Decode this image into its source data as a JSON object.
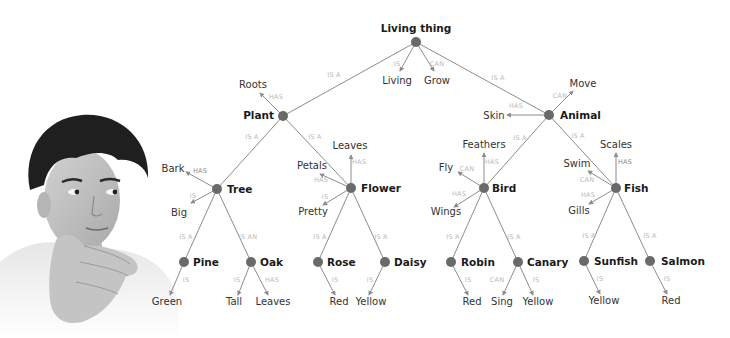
{
  "diagram": {
    "colors": {
      "node": "#6a6a6a",
      "edge": "#8c8c8c",
      "node_text": "#1a1a1a",
      "leaf_text": "#333333",
      "relation_text": "#b9b9b9"
    },
    "nodes": [
      {
        "id": "living_thing",
        "label": "Living thing",
        "x": 416,
        "y": 42,
        "lx": 416,
        "ly": 32,
        "anchor": "middle"
      },
      {
        "id": "plant",
        "label": "Plant",
        "x": 283,
        "y": 116,
        "lx": 274,
        "ly": 119,
        "anchor": "end"
      },
      {
        "id": "animal",
        "label": "Animal",
        "x": 549,
        "y": 115,
        "lx": 560,
        "ly": 119,
        "anchor": "start"
      },
      {
        "id": "tree",
        "label": "Tree",
        "x": 217,
        "y": 189,
        "lx": 227,
        "ly": 193,
        "anchor": "start"
      },
      {
        "id": "flower",
        "label": "Flower",
        "x": 351,
        "y": 188,
        "lx": 361,
        "ly": 192,
        "anchor": "start"
      },
      {
        "id": "bird",
        "label": "Bird",
        "x": 484,
        "y": 188,
        "lx": 492,
        "ly": 192,
        "anchor": "start"
      },
      {
        "id": "fish",
        "label": "Fish",
        "x": 616,
        "y": 188,
        "lx": 624,
        "ly": 192,
        "anchor": "start"
      },
      {
        "id": "pine",
        "label": "Pine",
        "x": 184,
        "y": 262,
        "lx": 193,
        "ly": 266,
        "anchor": "start"
      },
      {
        "id": "oak",
        "label": "Oak",
        "x": 251,
        "y": 262,
        "lx": 260,
        "ly": 266,
        "anchor": "start"
      },
      {
        "id": "rose",
        "label": "Rose",
        "x": 318,
        "y": 262,
        "lx": 327,
        "ly": 266,
        "anchor": "start"
      },
      {
        "id": "daisy",
        "label": "Daisy",
        "x": 385,
        "y": 262,
        "lx": 394,
        "ly": 266,
        "anchor": "start"
      },
      {
        "id": "robin",
        "label": "Robin",
        "x": 451,
        "y": 262,
        "lx": 461,
        "ly": 266,
        "anchor": "start"
      },
      {
        "id": "canary",
        "label": "Canary",
        "x": 518,
        "y": 262,
        "lx": 527,
        "ly": 266,
        "anchor": "start"
      },
      {
        "id": "sunfish",
        "label": "Sunfish",
        "x": 584,
        "y": 261,
        "lx": 594,
        "ly": 265,
        "anchor": "start"
      },
      {
        "id": "salmon",
        "label": "Salmon",
        "x": 650,
        "y": 261,
        "lx": 661,
        "ly": 265,
        "anchor": "start"
      }
    ],
    "hierarchy_edges": [
      {
        "from": "living_thing",
        "to": "plant",
        "relation": "IS A",
        "rx": 334,
        "ry": 77
      },
      {
        "from": "living_thing",
        "to": "animal",
        "relation": "IS A",
        "rx": 498,
        "ry": 80
      },
      {
        "from": "plant",
        "to": "tree",
        "relation": "IS A",
        "rx": 252,
        "ry": 139
      },
      {
        "from": "plant",
        "to": "flower",
        "relation": "IS A",
        "rx": 315,
        "ry": 139
      },
      {
        "from": "animal",
        "to": "bird",
        "relation": "IS A",
        "rx": 520,
        "ry": 140
      },
      {
        "from": "animal",
        "to": "fish",
        "relation": "IS A",
        "rx": 578,
        "ry": 138
      },
      {
        "from": "tree",
        "to": "pine",
        "relation": "IS A",
        "rx": 186,
        "ry": 239
      },
      {
        "from": "tree",
        "to": "oak",
        "relation": "IS AN",
        "rx": 248,
        "ry": 239
      },
      {
        "from": "flower",
        "to": "rose",
        "relation": "IS A",
        "rx": 320,
        "ry": 239
      },
      {
        "from": "flower",
        "to": "daisy",
        "relation": "IS A",
        "rx": 381,
        "ry": 239
      },
      {
        "from": "bird",
        "to": "robin",
        "relation": "IS A",
        "rx": 453,
        "ry": 239
      },
      {
        "from": "bird",
        "to": "canary",
        "relation": "IS A",
        "rx": 514,
        "ry": 239
      },
      {
        "from": "fish",
        "to": "sunfish",
        "relation": "IS A",
        "rx": 589,
        "ry": 238
      },
      {
        "from": "fish",
        "to": "salmon",
        "relation": "IS A",
        "rx": 650,
        "ry": 238
      }
    ],
    "attributes": [
      {
        "node": "living_thing",
        "relation": "IS",
        "label": "Living",
        "ax": 400,
        "ay": 71,
        "lx": 397,
        "ly": 84,
        "anchor": "middle",
        "rx": 397,
        "ry": 66
      },
      {
        "node": "living_thing",
        "relation": "CAN",
        "label": "Grow",
        "ax": 434,
        "ay": 71,
        "lx": 437,
        "ly": 84,
        "anchor": "middle",
        "rx": 437,
        "ry": 66
      },
      {
        "node": "plant",
        "relation": "HAS",
        "label": "Roots",
        "ax": 260,
        "ay": 93,
        "lx": 253,
        "ly": 88,
        "anchor": "middle",
        "rx": 276,
        "ry": 99
      },
      {
        "node": "animal",
        "relation": "CAN",
        "label": "Move",
        "ax": 573,
        "ay": 91,
        "lx": 583,
        "ly": 87,
        "anchor": "middle",
        "rx": 560,
        "ry": 98
      },
      {
        "node": "animal",
        "relation": "HAS",
        "label": "Skin",
        "ax": 507,
        "ay": 115,
        "lx": 494,
        "ly": 119,
        "anchor": "middle",
        "rx": 516,
        "ry": 108
      },
      {
        "node": "tree",
        "relation": "HAS",
        "label": "Bark",
        "ax": 186,
        "ay": 172,
        "lx": 173,
        "ly": 172,
        "anchor": "middle",
        "rx": 200,
        "ry": 173,
        "dark": true
      },
      {
        "node": "tree",
        "relation": "IS",
        "label": "Big",
        "ax": 191,
        "ay": 203,
        "lx": 179,
        "ly": 216,
        "anchor": "middle",
        "rx": 193,
        "ry": 198
      },
      {
        "node": "flower",
        "relation": "HAS",
        "label": "Leaves",
        "ax": 351,
        "ay": 155,
        "lx": 350,
        "ly": 149,
        "anchor": "middle",
        "rx": 359,
        "ry": 164
      },
      {
        "node": "flower",
        "relation": "HAS",
        "label": "Petals",
        "ax": 320,
        "ay": 174,
        "lx": 312,
        "ly": 169,
        "anchor": "middle",
        "rx": 321,
        "ry": 182
      },
      {
        "node": "flower",
        "relation": "IS",
        "label": "Pretty",
        "ax": 323,
        "ay": 205,
        "lx": 313,
        "ly": 215,
        "anchor": "middle",
        "rx": 325,
        "ry": 199
      },
      {
        "node": "bird",
        "relation": "HAS",
        "label": "Feathers",
        "ax": 484,
        "ay": 153,
        "lx": 484,
        "ly": 148,
        "anchor": "middle",
        "rx": 492,
        "ry": 164
      },
      {
        "node": "bird",
        "relation": "CAN",
        "label": "Fly",
        "ax": 458,
        "ay": 172,
        "lx": 446,
        "ly": 171,
        "anchor": "middle",
        "rx": 467,
        "ry": 171
      },
      {
        "node": "bird",
        "relation": "HAS",
        "label": "Wings",
        "ax": 454,
        "ay": 207,
        "lx": 446,
        "ly": 215,
        "anchor": "middle",
        "rx": 459,
        "ry": 196
      },
      {
        "node": "fish",
        "relation": "HAS",
        "label": "Scales",
        "ax": 616,
        "ay": 153,
        "lx": 616,
        "ly": 148,
        "anchor": "middle",
        "rx": 625,
        "ry": 164,
        "dark": true
      },
      {
        "node": "fish",
        "relation": "CAN",
        "label": "Swim",
        "ax": 588,
        "ay": 171,
        "lx": 577,
        "ly": 167,
        "anchor": "middle",
        "rx": 587,
        "ry": 182
      },
      {
        "node": "fish",
        "relation": "HAS",
        "label": "Gills",
        "ax": 589,
        "ay": 204,
        "lx": 579,
        "ly": 214,
        "anchor": "middle",
        "rx": 588,
        "ry": 197
      },
      {
        "node": "pine",
        "relation": "IS",
        "label": "Green",
        "ax": 170,
        "ay": 295,
        "lx": 167,
        "ly": 305,
        "anchor": "middle",
        "rx": 186,
        "ry": 282
      },
      {
        "node": "oak",
        "relation": "IS",
        "label": "Tall",
        "ax": 238,
        "ay": 295,
        "lx": 234,
        "ly": 305,
        "anchor": "middle",
        "rx": 237,
        "ry": 282
      },
      {
        "node": "oak",
        "relation": "HAS",
        "label": "Leaves",
        "ax": 268,
        "ay": 295,
        "lx": 273,
        "ly": 305,
        "anchor": "middle",
        "rx": 272,
        "ry": 282
      },
      {
        "node": "rose",
        "relation": "IS",
        "label": "Red",
        "ax": 335,
        "ay": 295,
        "lx": 339,
        "ly": 305,
        "anchor": "middle",
        "rx": 335,
        "ry": 282
      },
      {
        "node": "daisy",
        "relation": "IS",
        "label": "Yellow",
        "ax": 369,
        "ay": 295,
        "lx": 371,
        "ly": 305,
        "anchor": "middle",
        "rx": 370,
        "ry": 282
      },
      {
        "node": "robin",
        "relation": "IS",
        "label": "Red",
        "ax": 468,
        "ay": 295,
        "lx": 472,
        "ly": 305,
        "anchor": "middle",
        "rx": 468,
        "ry": 282
      },
      {
        "node": "canary",
        "relation": "CAN",
        "label": "Sing",
        "ax": 503,
        "ay": 295,
        "lx": 502,
        "ly": 305,
        "anchor": "middle",
        "rx": 497,
        "ry": 282
      },
      {
        "node": "canary",
        "relation": "IS",
        "label": "Yellow",
        "ax": 533,
        "ay": 295,
        "lx": 538,
        "ly": 305,
        "anchor": "middle",
        "rx": 536,
        "ry": 282
      },
      {
        "node": "sunfish",
        "relation": "IS",
        "label": "Yellow",
        "ax": 600,
        "ay": 294,
        "lx": 604,
        "ly": 304,
        "anchor": "middle",
        "rx": 600,
        "ry": 281
      },
      {
        "node": "salmon",
        "relation": "IS",
        "label": "Red",
        "ax": 667,
        "ay": 294,
        "lx": 671,
        "ly": 304,
        "anchor": "middle",
        "rx": 667,
        "ry": 281
      }
    ]
  },
  "image": {
    "description": "Photo of a young man with dark hair resting chin on hand, looking to the side",
    "alt": "Thinking person"
  }
}
